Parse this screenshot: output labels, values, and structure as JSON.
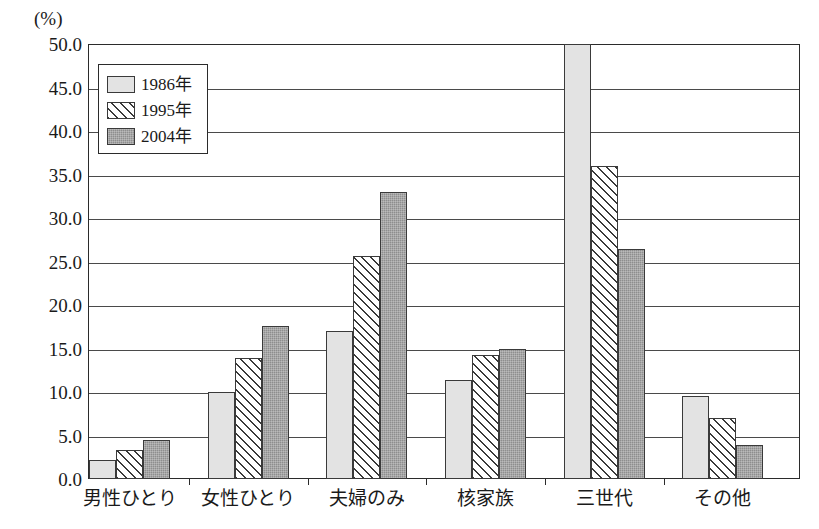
{
  "chart_data": {
    "type": "bar",
    "title": "",
    "xlabel": "",
    "ylabel": "(%)",
    "unit_label": "(%)",
    "ylim": [
      0.0,
      50.0
    ],
    "ytick_step": 5.0,
    "yticks": [
      "0.0",
      "5.0",
      "10.0",
      "15.0",
      "20.0",
      "25.0",
      "30.0",
      "35.0",
      "40.0",
      "45.0",
      "50.0"
    ],
    "grid": true,
    "legend_position": "top-left-inside",
    "categories": [
      "男性ひとり",
      "女性ひとり",
      "夫婦のみ",
      "核家族",
      "三世代",
      "その他"
    ],
    "series": [
      {
        "name": "1986年",
        "style": "light-gray-solid",
        "color": "#e3e3e3",
        "values": [
          2.2,
          10.0,
          17.0,
          11.4,
          50.0,
          9.5
        ]
      },
      {
        "name": "1995年",
        "style": "diagonal-hatch",
        "color": "#ffffff",
        "values": [
          3.3,
          13.9,
          25.6,
          14.2,
          36.0,
          7.0
        ]
      },
      {
        "name": "2004年",
        "style": "dark-gray-solid",
        "color": "#8e8e8e",
        "values": [
          4.5,
          17.6,
          33.0,
          15.0,
          26.4,
          3.9
        ]
      }
    ]
  },
  "legend": {
    "items": [
      {
        "label": "1986年",
        "swatch": "legend-swatch-1986"
      },
      {
        "label": "1995年",
        "swatch": "legend-swatch-1995"
      },
      {
        "label": "2004年",
        "swatch": "legend-swatch-2004"
      }
    ]
  }
}
